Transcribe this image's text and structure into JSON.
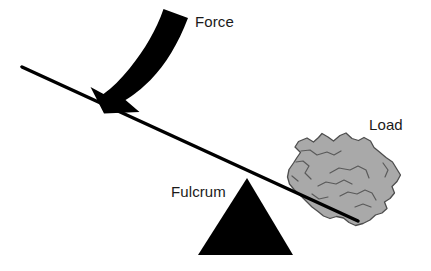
{
  "diagram": {
    "type": "physics-lever-diagram",
    "background_color": "#ffffff",
    "labels": {
      "force": "Force",
      "fulcrum": "Fulcrum",
      "load": "Load"
    },
    "colors": {
      "ink": "#000000",
      "label_text": "#1a1a1a",
      "rock_fill": "#a9a9a9",
      "rock_stroke": "#4d4d4d",
      "rock_crack": "#5a5a5a",
      "beam": "#000000",
      "fulcrum_fill": "#000000",
      "arrow_fill": "#000000"
    },
    "elements": [
      {
        "name": "beam",
        "kind": "line",
        "description": "tilted lever bar sloping down to the right",
        "from": [
          22,
          67
        ],
        "to": [
          358,
          221
        ],
        "stroke_width": 3.4
      },
      {
        "name": "fulcrum",
        "kind": "triangle",
        "description": "solid black triangular pivot under the beam",
        "apex": [
          247,
          178
        ],
        "base_left": [
          198,
          255
        ],
        "base_right": [
          293,
          255
        ]
      },
      {
        "name": "force-arrow",
        "kind": "curved-arrow",
        "description": "thick curved arrow sweeping from upper right down to the left end of the beam",
        "tail": [
          188,
          18
        ],
        "tip": [
          112,
          106
        ]
      },
      {
        "name": "load-rock",
        "kind": "polygon",
        "description": "gray jagged rock resting on the right end of the beam",
        "bounds": [
          287,
          133,
          401,
          226
        ]
      }
    ]
  }
}
